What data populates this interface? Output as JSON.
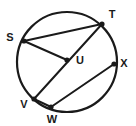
{
  "figure": {
    "type": "geometry-diagram",
    "background_color": "#ffffff",
    "stroke_color": "#1a1a1a",
    "circle": {
      "name": "circle-U",
      "center_x": 67,
      "center_y": 62,
      "radius": 50,
      "stroke_width": 2.2
    },
    "points": [
      {
        "id": "S",
        "label": "S",
        "x": 24,
        "y": 41,
        "label_x": 10,
        "label_y": 38,
        "on_circle": true,
        "is_center": false,
        "dot_radius": 2.6
      },
      {
        "id": "T",
        "label": "T",
        "x": 102,
        "y": 24,
        "label_x": 112,
        "label_y": 15,
        "on_circle": true,
        "is_center": false,
        "dot_radius": 2.6
      },
      {
        "id": "U",
        "label": "U",
        "x": 67,
        "y": 60,
        "label_x": 76,
        "label_y": 61,
        "on_circle": false,
        "is_center": true,
        "dot_radius": 2.6
      },
      {
        "id": "V",
        "label": "V",
        "x": 34,
        "y": 99,
        "label_x": 24,
        "label_y": 105,
        "on_circle": true,
        "is_center": false,
        "dot_radius": 2.6
      },
      {
        "id": "W",
        "label": "W",
        "x": 51,
        "y": 107,
        "label_x": 52,
        "label_y": 120,
        "on_circle": true,
        "is_center": false,
        "dot_radius": 2.6
      },
      {
        "id": "X",
        "label": "X",
        "x": 114,
        "y": 64,
        "label_x": 124,
        "label_y": 64,
        "on_circle": true,
        "is_center": false,
        "dot_radius": 2.6
      }
    ],
    "segments": [
      {
        "id": "chord-S-T",
        "from": "S",
        "to": "T",
        "label": "chord ST",
        "stroke_width": 2.0
      },
      {
        "id": "chord-T-V",
        "from": "T",
        "to": "V",
        "label": "chord TV through U",
        "stroke_width": 2.0
      },
      {
        "id": "segment-S-U",
        "from": "S",
        "to": "U",
        "label": "segment SU",
        "stroke_width": 2.0
      },
      {
        "id": "chord-W-X",
        "from": "W",
        "to": "X",
        "label": "chord WX",
        "stroke_width": 2.0
      },
      {
        "id": "segment-V-W",
        "from": "V",
        "to": "W",
        "label": "segment VW",
        "stroke_width": 2.0
      }
    ]
  }
}
